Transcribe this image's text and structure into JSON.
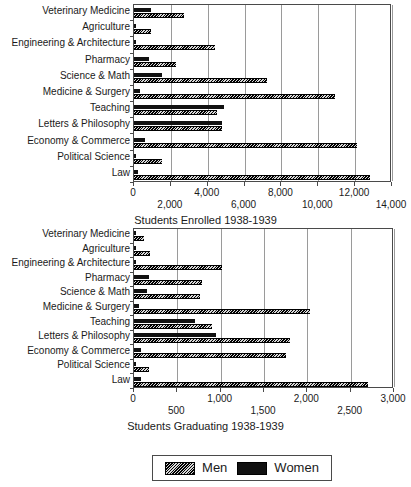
{
  "legend": {
    "position": "bottom",
    "entries": [
      {
        "name": "Men",
        "swatch": "hatched",
        "color": "#3a3a3a"
      },
      {
        "name": "Women",
        "swatch": "solid",
        "color": "#111111"
      }
    ]
  },
  "chart_data": [
    {
      "type": "bar",
      "orientation": "horizontal",
      "title": "",
      "xlabel": "Students Enrolled 1938-1939",
      "ylabel": "",
      "xlim": [
        0,
        14000
      ],
      "xticks": [
        0,
        2000,
        4000,
        6000,
        8000,
        10000,
        12000,
        14000
      ],
      "xticklabels": [
        "0",
        "2,000",
        "4,000",
        "6,000",
        "8,000",
        "10,000",
        "12,000",
        "14,000"
      ],
      "grid": true,
      "categories": [
        "Veterinary Medicine",
        "Agriculture",
        "Engineering & Architecture",
        "Pharmacy",
        "Science & Math",
        "Medicine & Surgery",
        "Teaching",
        "Letters & Philosophy",
        "Economy & Commerce",
        "Political Science",
        "Law"
      ],
      "series": [
        {
          "name": "Women",
          "values": [
            900,
            60,
            80,
            800,
            1500,
            300,
            4900,
            4800,
            600,
            40,
            200
          ]
        },
        {
          "name": "Men",
          "values": [
            2700,
            900,
            4400,
            2300,
            7200,
            10900,
            4500,
            4800,
            12100,
            1500,
            12800
          ]
        }
      ]
    },
    {
      "type": "bar",
      "orientation": "horizontal",
      "title": "",
      "xlabel": "Students Graduating 1938-1939",
      "ylabel": "",
      "xlim": [
        0,
        3000
      ],
      "xticks": [
        0,
        500,
        1000,
        1500,
        2000,
        2500,
        3000
      ],
      "xticklabels": [
        "0",
        "500",
        "1,000",
        "1,500",
        "2,000",
        "2,500",
        "3,000"
      ],
      "grid": true,
      "categories": [
        "Veterinary Medicine",
        "Agriculture",
        "Engineering & Architecture",
        "Pharmacy",
        "Science & Math",
        "Medicine & Surgery",
        "Teaching",
        "Letters & Philosophy",
        "Economy & Commerce",
        "Political Science",
        "Law"
      ],
      "series": [
        {
          "name": "Women",
          "values": [
            20,
            15,
            20,
            170,
            155,
            60,
            700,
            950,
            80,
            15,
            80
          ]
        },
        {
          "name": "Men",
          "values": [
            120,
            180,
            1010,
            780,
            760,
            2030,
            900,
            1800,
            1750,
            170,
            2700
          ]
        }
      ]
    }
  ]
}
